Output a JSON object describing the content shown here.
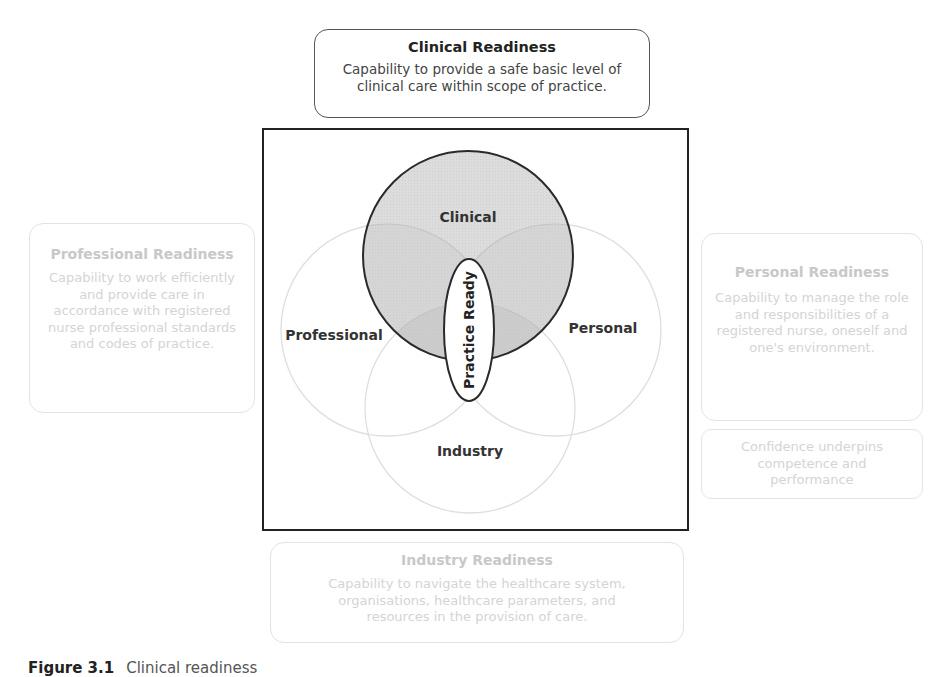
{
  "clinical_readiness": {
    "title": "Clinical Readiness",
    "description": "Capability to provide a safe basic level of clinical care within scope of practice."
  },
  "professional_readiness": {
    "title": "Professional Readiness",
    "description": "Capability to work efficiently and provide care in accordance with registered nurse professional standards and codes of practice."
  },
  "personal_readiness": {
    "title": "Personal Readiness",
    "description": "Capability to manage the role and responsibilities of a registered nurse, oneself and one's environment."
  },
  "confidence_note": {
    "description": "Confidence underpins competence and performance"
  },
  "industry_readiness": {
    "title": "Industry Readiness",
    "description": "Capability to navigate the healthcare system, organisations, healthcare parameters, and resources in the provision of care."
  },
  "venn": {
    "labels": {
      "clinical": "Clinical",
      "professional": "Professional",
      "personal": "Personal",
      "industry": "Industry",
      "center": "Practice Ready"
    },
    "colors": {
      "highlight_fill": "#d9d9d9",
      "highlight_stroke": "#222222",
      "faded_stroke": "#dddddd",
      "frame": "#222222"
    }
  },
  "caption": {
    "number": "Figure 3.1",
    "text": "Clinical readiness"
  }
}
